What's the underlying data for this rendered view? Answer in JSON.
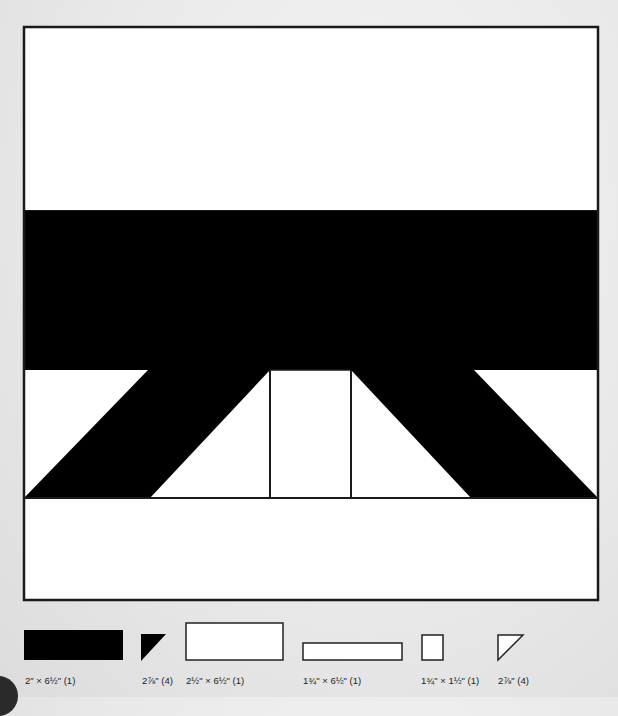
{
  "diagram": {
    "type": "quilt-block",
    "colors": {
      "dark": "#000000",
      "light": "#ffffff",
      "outline": "#1a1a1a",
      "background": "#e8e8e8"
    },
    "block": {
      "bounds": {
        "x": 24,
        "y": 27,
        "width": 574,
        "height": 573
      },
      "rows": [
        {
          "name": "top-white-band",
          "y0": 27,
          "y1": 211,
          "fill": "light"
        },
        {
          "name": "black-band",
          "y0": 211,
          "y1": 370,
          "fill": "dark"
        },
        {
          "name": "triangle-row",
          "y0": 370,
          "y1": 498
        },
        {
          "name": "bottom-white-band",
          "y0": 498,
          "y1": 600,
          "fill": "light"
        }
      ]
    },
    "legend": [
      {
        "label": "2\" × 6½\" (1)",
        "shape": "rect",
        "fill": "dark"
      },
      {
        "label": "2⅞\" (4)",
        "shape": "half-square-triangle",
        "fill": "dark"
      },
      {
        "label": "2½\" × 6½\" (1)",
        "shape": "rect",
        "fill": "light"
      },
      {
        "label": "1¾\" × 6½\" (1)",
        "shape": "rect",
        "fill": "light"
      },
      {
        "label": "1¾\" × 1½\" (1)",
        "shape": "rect",
        "fill": "light"
      },
      {
        "label": "2⅞\" (4)",
        "shape": "half-square-triangle",
        "fill": "light"
      }
    ]
  }
}
